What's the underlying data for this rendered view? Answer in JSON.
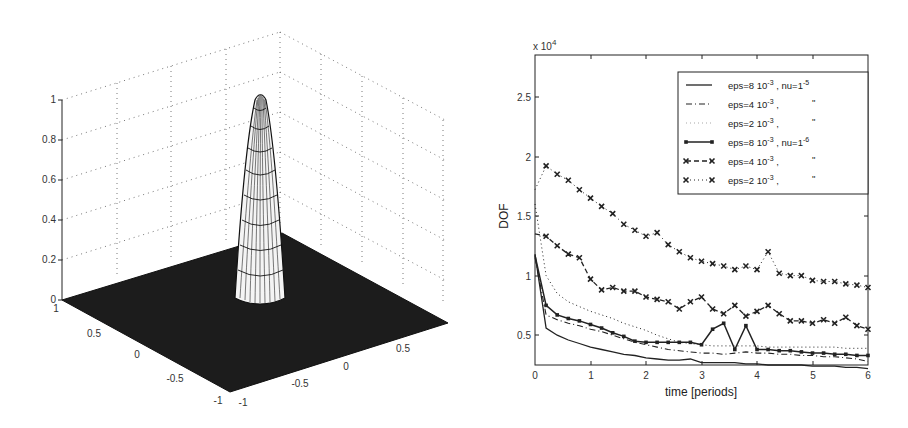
{
  "chart_data": [
    {
      "type": "surface3d",
      "title": "",
      "xlabel": "",
      "ylabel": "",
      "zlabel": "",
      "x_ticks": [
        "-1",
        "-0.5",
        "0",
        "0.5",
        "1"
      ],
      "y_ticks": [
        "-1",
        "-0.5",
        "0",
        "0.5",
        "1"
      ],
      "z_ticks": [
        "0",
        "0.2",
        "0.4",
        "0.6",
        "0.8",
        "1"
      ],
      "xlim": [
        -1,
        1
      ],
      "ylim": [
        -1,
        1
      ],
      "zlim": [
        0,
        1
      ],
      "grid": true,
      "description": "Narrow bell-shaped peak of height 1 centred near (0.25, 0.5) on a flat zero plane"
    },
    {
      "type": "line",
      "title": "",
      "xlabel": "time [periods]",
      "ylabel": "DOF",
      "y_multiplier": "x 10^4",
      "x_ticks": [
        "0",
        "1",
        "2",
        "3",
        "4",
        "5",
        "6"
      ],
      "y_ticks": [
        "0.5",
        "1",
        "1.5",
        "2",
        "2.5"
      ],
      "xlim": [
        0,
        6
      ],
      "ylim": [
        0.25,
        2.85
      ],
      "grid": false,
      "legend_position": "upper right",
      "x": [
        0,
        0.2,
        0.4,
        0.6,
        0.8,
        1.0,
        1.2,
        1.4,
        1.6,
        1.8,
        2.0,
        2.2,
        2.4,
        2.6,
        2.8,
        3.0,
        3.2,
        3.4,
        3.6,
        3.8,
        4.0,
        4.2,
        4.4,
        4.6,
        4.8,
        5.0,
        5.2,
        5.4,
        5.6,
        5.8,
        6.0
      ],
      "series": [
        {
          "name": "eps=8 10^-3 , nu=1^-5",
          "style": "solid",
          "values": [
            1.18,
            0.56,
            0.5,
            0.46,
            0.43,
            0.4,
            0.38,
            0.36,
            0.34,
            0.33,
            0.31,
            0.3,
            0.29,
            0.29,
            0.3,
            0.27,
            0.27,
            0.27,
            0.27,
            0.26,
            0.26,
            0.25,
            0.25,
            0.25,
            0.25,
            0.24,
            0.24,
            0.24,
            0.23,
            0.23,
            0.22
          ]
        },
        {
          "name": "eps=4 10^-3 ,",
          "style": "dashdot",
          "values": [
            1.15,
            0.67,
            0.63,
            0.6,
            0.58,
            0.55,
            0.53,
            0.5,
            0.47,
            0.44,
            0.42,
            0.4,
            0.38,
            0.37,
            0.36,
            0.35,
            0.35,
            0.34,
            0.35,
            0.36,
            0.35,
            0.35,
            0.34,
            0.34,
            0.33,
            0.33,
            0.32,
            0.32,
            0.31,
            0.3,
            0.28
          ]
        },
        {
          "name": "eps=2 10^-3 ,",
          "style": "dotted",
          "values": [
            1.6,
            1.0,
            0.85,
            0.78,
            0.74,
            0.7,
            0.67,
            0.64,
            0.6,
            0.57,
            0.54,
            0.5,
            0.47,
            0.44,
            0.43,
            0.42,
            0.41,
            0.41,
            0.41,
            0.41,
            0.41,
            0.4,
            0.4,
            0.4,
            0.4,
            0.4,
            0.4,
            0.4,
            0.39,
            0.39,
            0.39
          ]
        },
        {
          "name": "eps=8 10^-3 , nu=1^-6",
          "style": "solid-marker",
          "values": [
            1.17,
            0.75,
            0.67,
            0.64,
            0.62,
            0.59,
            0.56,
            0.52,
            0.49,
            0.45,
            0.44,
            0.44,
            0.44,
            0.44,
            0.44,
            0.42,
            0.55,
            0.6,
            0.38,
            0.58,
            0.38,
            0.38,
            0.37,
            0.37,
            0.36,
            0.35,
            0.35,
            0.34,
            0.34,
            0.33,
            0.33
          ]
        },
        {
          "name": "eps=4 10^-3 ,",
          "style": "dashed-x",
          "values": [
            1.35,
            1.33,
            1.25,
            1.18,
            1.15,
            0.97,
            0.88,
            0.9,
            0.87,
            0.87,
            0.82,
            0.8,
            0.78,
            0.72,
            0.78,
            0.82,
            0.72,
            0.68,
            0.75,
            0.66,
            0.7,
            0.75,
            0.68,
            0.62,
            0.62,
            0.6,
            0.63,
            0.6,
            0.65,
            0.58,
            0.55
          ]
        },
        {
          "name": "eps=2 10^-3 ,",
          "style": "dotted-x",
          "values": [
            1.72,
            1.92,
            1.85,
            1.8,
            1.72,
            1.65,
            1.58,
            1.52,
            1.43,
            1.38,
            1.33,
            1.36,
            1.26,
            1.2,
            1.15,
            1.12,
            1.1,
            1.08,
            1.05,
            1.08,
            1.05,
            1.2,
            1.02,
            1.0,
            1.0,
            0.96,
            0.95,
            0.95,
            0.93,
            0.92,
            0.9
          ]
        }
      ],
      "legend": [
        {
          "line": "solid",
          "label_main": "eps=8 10",
          "label_exp": "-3",
          "label_tail": " , nu=1",
          "label_tail_exp": "-5"
        },
        {
          "line": "dashdot",
          "label_main": "eps=4 10",
          "label_exp": "-3",
          "label_tail": " ,",
          "ditto": "\""
        },
        {
          "line": "dotted",
          "label_main": "eps=2 10",
          "label_exp": "-3",
          "label_tail": " ,",
          "ditto": "\""
        },
        {
          "line": "solid-marker",
          "label_main": "eps=8 10",
          "label_exp": "-3",
          "label_tail": " , nu=1",
          "label_tail_exp": "-6"
        },
        {
          "line": "dashed-x",
          "label_main": "eps=4 10",
          "label_exp": "-3",
          "label_tail": " ,",
          "ditto": "\""
        },
        {
          "line": "dotted-x",
          "label_main": "eps=2 10",
          "label_exp": "-3",
          "label_tail": " ,",
          "ditto": "\""
        }
      ]
    }
  ],
  "labels": {
    "multiplier_base": "x 10",
    "multiplier_exp": "4"
  }
}
